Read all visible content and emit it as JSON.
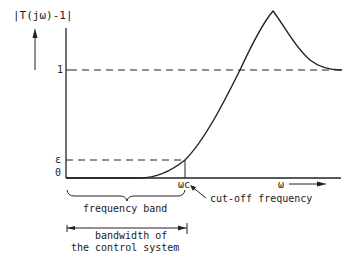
{
  "diagram": {
    "y_axis_label": "|T(jω)-1|",
    "x_axis_label": "ω",
    "y_ticks": {
      "one": "1",
      "epsilon": "ε",
      "zero": "0"
    },
    "cutoff_marker": "ωc",
    "cutoff_annotation": "cut-off frequency",
    "frequency_band_label": "frequency band",
    "bandwidth_label_line1": "bandwidth of",
    "bandwidth_label_line2": "the control system",
    "colors": {
      "ink": "#222222",
      "background": "#ffffff"
    }
  }
}
